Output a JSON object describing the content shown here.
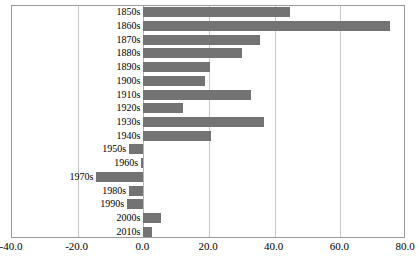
{
  "chart_data": {
    "type": "bar",
    "orientation": "horizontal",
    "title": "",
    "subtitle": "",
    "xlabel": "",
    "ylabel": "",
    "xlim": [
      -40.0,
      80.0
    ],
    "xticks": [
      -40.0,
      -20.0,
      0.0,
      20.0,
      40.0,
      60.0,
      80.0
    ],
    "xtick_labels": [
      "-40.0",
      "-20.0",
      "0.0",
      "20.0",
      "40.0",
      "60.0",
      "80.0"
    ],
    "grid": true,
    "grid_axis": "x",
    "legend": false,
    "legend_position": "none",
    "bar_color": "#737373",
    "categories": [
      "1850s",
      "1860s",
      "1870s",
      "1880s",
      "1890s",
      "1900s",
      "1910s",
      "1920s",
      "1930s",
      "1940s",
      "1950s",
      "1960s",
      "1970s",
      "1980s",
      "1990s",
      "2000s",
      "2010s"
    ],
    "values": [
      44.8,
      75.2,
      35.6,
      30.2,
      20.4,
      18.9,
      32.9,
      12.2,
      36.9,
      20.7,
      -4.3,
      -0.7,
      -14.3,
      -4.3,
      -4.9,
      5.5,
      2.7
    ]
  },
  "axis": {
    "tick_0": "-40.0",
    "tick_1": "-20.0",
    "tick_2": "0.0",
    "tick_3": "20.0",
    "tick_4": "40.0",
    "tick_5": "60.0",
    "tick_6": "80.0"
  }
}
